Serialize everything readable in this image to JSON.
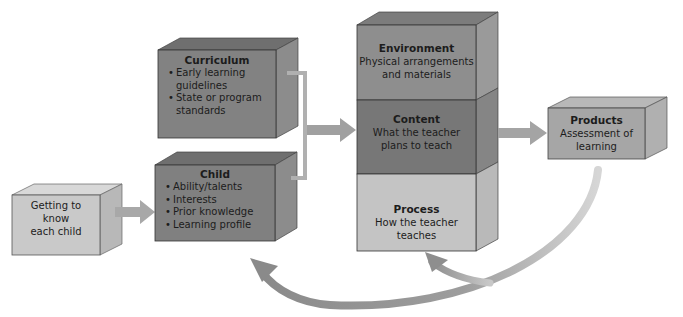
{
  "diagram": {
    "nodes": {
      "getting_to_know": {
        "label": "Getting to know each child",
        "lines": [
          "Getting to",
          "know",
          "each child"
        ]
      },
      "curriculum": {
        "title": "Curriculum",
        "bullets": [
          "Early learning guidelines",
          "State or program standards"
        ]
      },
      "child": {
        "title": "Child",
        "bullets": [
          "Ability/talents",
          "Interests",
          "Prior knowledge",
          "Learning profile"
        ]
      },
      "environment": {
        "title": "Environment",
        "lines": [
          "Physical arrangements",
          "and materials"
        ]
      },
      "content": {
        "title": "Content",
        "lines": [
          "What the teacher",
          "plans to teach"
        ]
      },
      "process": {
        "title": "Process",
        "lines": [
          "How the teacher",
          "teaches"
        ]
      },
      "products": {
        "title": "Products",
        "lines": [
          "Assessment of",
          "learning"
        ]
      }
    },
    "edges": [
      {
        "from": "getting_to_know",
        "to": "child"
      },
      {
        "from": "curriculum",
        "to": "environment-content-process stack"
      },
      {
        "from": "child",
        "to": "environment-content-process stack"
      },
      {
        "from": "content",
        "to": "products"
      },
      {
        "from": "products",
        "to": "process",
        "style": "curved"
      },
      {
        "from": "products",
        "to": "child",
        "style": "curved"
      }
    ],
    "colors": {
      "light_box": "#c9c9c9",
      "mid_box": "#8f8f8f",
      "dark_box": "#7a7a7a",
      "arrow": "#9a9a9a"
    }
  }
}
